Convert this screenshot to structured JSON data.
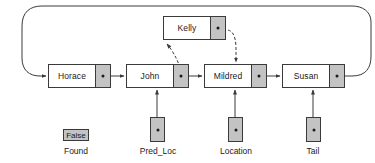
{
  "diagram": {
    "colors": {
      "stroke": "#3a3a3a",
      "pointer_fill": "#c3c3c3",
      "node_fill": "#ffffff",
      "text": "#1a1a1a",
      "background": "#ffffff"
    },
    "nodes": [
      {
        "id": "horace",
        "label": "Horace",
        "x": 48,
        "y": 64,
        "width": 63,
        "height": 24
      },
      {
        "id": "john",
        "label": "John",
        "x": 126,
        "y": 64,
        "width": 63,
        "height": 24
      },
      {
        "id": "mildred",
        "label": "Mildred",
        "x": 204,
        "y": 64,
        "width": 63,
        "height": 24
      },
      {
        "id": "susan",
        "label": "Susan",
        "x": 282,
        "y": 64,
        "width": 63,
        "height": 24
      },
      {
        "id": "kelly",
        "label": "Kelly",
        "x": 163,
        "y": 16,
        "width": 63,
        "height": 24
      }
    ],
    "variables": [
      {
        "id": "found",
        "label": "Found",
        "value": "False",
        "kind": "value",
        "x": 63,
        "y": 129,
        "width": 26,
        "height": 12,
        "label_x": 55,
        "label_y": 146,
        "label_width": 42
      },
      {
        "id": "pred_loc",
        "label": "Pred_Loc",
        "kind": "pointer",
        "x": 150,
        "y": 117,
        "width": 15,
        "height": 25,
        "label_x": 132,
        "label_y": 146,
        "label_width": 52
      },
      {
        "id": "location",
        "label": "Location",
        "kind": "pointer",
        "x": 228,
        "y": 117,
        "width": 15,
        "height": 25,
        "label_x": 210,
        "label_y": 146,
        "label_width": 52
      },
      {
        "id": "tail",
        "label": "Tail",
        "kind": "pointer",
        "x": 306,
        "y": 117,
        "width": 15,
        "height": 25,
        "label_x": 292,
        "label_y": 146,
        "label_width": 42
      }
    ],
    "edges": [
      {
        "id": "horace-to-john",
        "from": "horace",
        "to": "john",
        "style": "solid"
      },
      {
        "id": "john-to-mildred",
        "from": "john",
        "to": "mildred",
        "style": "solid"
      },
      {
        "id": "mildred-to-susan",
        "from": "mildred",
        "to": "susan",
        "style": "solid"
      },
      {
        "id": "susan-to-horace-wrap",
        "from": "susan",
        "to": "horace",
        "style": "solid"
      },
      {
        "id": "john-to-kelly",
        "from": "john",
        "to": "kelly",
        "style": "dashed"
      },
      {
        "id": "kelly-to-mildred",
        "from": "kelly",
        "to": "mildred",
        "style": "dashed"
      },
      {
        "id": "pred_loc-to-john",
        "from": "pred_loc",
        "to": "john",
        "style": "solid"
      },
      {
        "id": "location-to-mildred",
        "from": "location",
        "to": "mildred",
        "style": "solid"
      },
      {
        "id": "tail-to-susan",
        "from": "tail",
        "to": "susan",
        "style": "solid"
      }
    ]
  }
}
